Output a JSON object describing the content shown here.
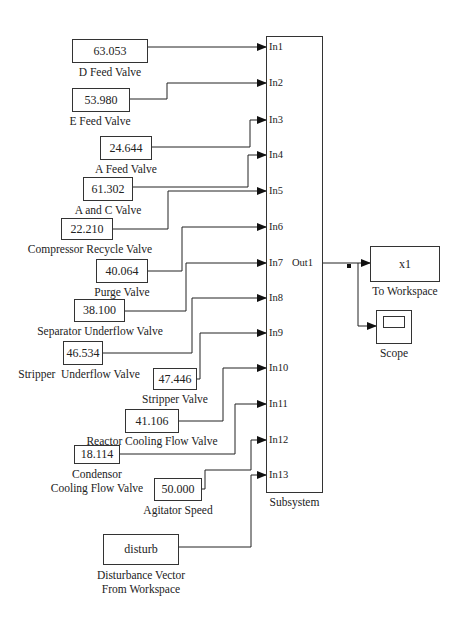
{
  "diagram": {
    "subsystem": {
      "label": "Subsystem",
      "inputs": [
        "In1",
        "In2",
        "In3",
        "In4",
        "In5",
        "In6",
        "In7",
        "In8",
        "In9",
        "In10",
        "In11",
        "In12",
        "In13"
      ],
      "output": "Out1"
    },
    "constants": [
      {
        "id": "d-feed",
        "value": "63.053",
        "label": "D Feed Valve",
        "port": 1
      },
      {
        "id": "e-feed",
        "value": "53.980",
        "label": "E Feed Valve",
        "port": 2
      },
      {
        "id": "a-feed",
        "value": "24.644",
        "label": "A Feed Valve",
        "port": 3
      },
      {
        "id": "a-and-c",
        "value": "61.302",
        "label": "A and C Valve",
        "port": 4
      },
      {
        "id": "compressor-recycle",
        "value": "22.210",
        "label": "Compressor Recycle Valve",
        "port": 5
      },
      {
        "id": "purge",
        "value": "40.064",
        "label": "Purge Valve",
        "port": 6
      },
      {
        "id": "separator-underflow",
        "value": "38.100",
        "label": "Separator Underflow Valve",
        "port": 7
      },
      {
        "id": "stripper-underflow",
        "value": "46.534",
        "label": "Stripper  Underflow Valve",
        "port": 8
      },
      {
        "id": "stripper",
        "value": "47.446",
        "label": "Stripper Valve",
        "port": 9
      },
      {
        "id": "reactor-cooling",
        "value": "41.106",
        "label": "Reactor Cooling Flow Valve",
        "port": 10
      },
      {
        "id": "condensor-cooling",
        "value": "18.114",
        "label_line1": "Condensor",
        "label_line2": "Cooling Flow Valve",
        "port": 11
      },
      {
        "id": "agitator",
        "value": "50.000",
        "label": "Agitator Speed",
        "port": 12
      }
    ],
    "workspace_source": {
      "value": "disturb",
      "label_line1": "Disturbance Vector",
      "label_line2": "From Workspace",
      "port": 13
    },
    "to_workspace": {
      "value": "x1",
      "label": "To Workspace"
    },
    "scope": {
      "label": "Scope"
    }
  }
}
